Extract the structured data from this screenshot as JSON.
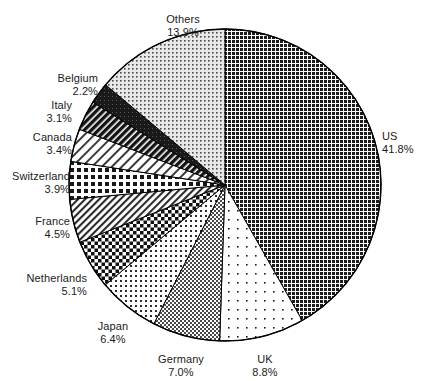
{
  "chart_data": {
    "type": "pie",
    "title": "",
    "subtitle": "",
    "xlabel": "",
    "ylabel": "",
    "legend_position": "none",
    "grid": false,
    "value_unit": "%",
    "start_angle_deg": 0,
    "direction": "clockwise",
    "categories": [
      "US",
      "UK",
      "Germany",
      "Japan",
      "Netherlands",
      "France",
      "Switzerland",
      "Canada",
      "Italy",
      "Belgium",
      "Others"
    ],
    "values": [
      41.8,
      8.8,
      7.0,
      6.4,
      5.1,
      4.5,
      3.9,
      3.4,
      3.1,
      2.2,
      13.9
    ],
    "slices": [
      {
        "name": "US",
        "value": 41.8,
        "label": "US",
        "value_label": "41.8%",
        "pattern": "dense-dark-grid",
        "label_side": "right",
        "label_x": 382,
        "label_y": 130
      },
      {
        "name": "UK",
        "value": 8.8,
        "label": "UK",
        "value_label": "8.8%",
        "pattern": "sparse-dots",
        "label_side": "center",
        "label_x": 265,
        "label_y": 353
      },
      {
        "name": "Germany",
        "value": 7.0,
        "label": "Germany",
        "value_label": "7.0%",
        "pattern": "gray-checker",
        "label_side": "center",
        "label_x": 181,
        "label_y": 353
      },
      {
        "name": "Japan",
        "value": 6.4,
        "label": "Japan",
        "value_label": "6.4%",
        "pattern": "light-dot-checker",
        "label_side": "center",
        "label_x": 113,
        "label_y": 320
      },
      {
        "name": "Netherlands",
        "value": 5.1,
        "label": "Netherlands",
        "value_label": "5.1%",
        "pattern": "bold-checker",
        "label_side": "left",
        "label_x": 87,
        "label_y": 272
      },
      {
        "name": "France",
        "value": 4.5,
        "label": "France",
        "value_label": "4.5%",
        "pattern": "fine-diagonal-hatch",
        "label_side": "left",
        "label_x": 70,
        "label_y": 215
      },
      {
        "name": "Switzerland",
        "value": 3.9,
        "label": "Switzerland",
        "value_label": "3.9%",
        "pattern": "coarse-dark-checker",
        "label_side": "left",
        "label_x": 70,
        "label_y": 170
      },
      {
        "name": "Canada",
        "value": 3.4,
        "label": "Canada",
        "value_label": "3.4%",
        "pattern": "light-diagonal-hatch",
        "label_side": "left",
        "label_x": 72,
        "label_y": 131
      },
      {
        "name": "Italy",
        "value": 3.1,
        "label": "Italy",
        "value_label": "3.1%",
        "pattern": "dark-diagonal-hatch",
        "label_side": "left",
        "label_x": 72,
        "label_y": 99
      },
      {
        "name": "Belgium",
        "value": 2.2,
        "label": "Belgium",
        "value_label": "2.2%",
        "pattern": "solid-dark",
        "label_side": "left",
        "label_x": 98,
        "label_y": 72
      },
      {
        "name": "Others",
        "value": 13.9,
        "label": "Others",
        "value_label": "13.9%",
        "pattern": "light-gray-dots",
        "label_side": "center",
        "label_x": 183,
        "label_y": 13
      }
    ],
    "geometry": {
      "center_x": 225,
      "center_y": 185,
      "radius": 156
    }
  },
  "colors": {
    "outline": "#000000",
    "background": "#ffffff",
    "text": "#1b1b1b",
    "dark_fill": "#2b2b2b",
    "mid_fill": "#808080",
    "light_fill": "#d9d9d9"
  }
}
